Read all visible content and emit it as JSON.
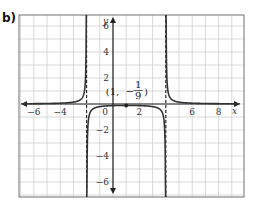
{
  "part_label": "b)",
  "chart_data": {
    "type": "line",
    "title": "",
    "function": "y = 1/((x+2)(x-4))",
    "xlabel": "x",
    "ylabel": "y",
    "xlim": [
      -7,
      10
    ],
    "ylim": [
      -7,
      7
    ],
    "grid": true,
    "x_tick_labels": [
      "-6",
      "-4",
      "0",
      "2",
      "6",
      "8"
    ],
    "y_tick_labels": [
      "6",
      "4",
      "2",
      "-2",
      "-4",
      "-6"
    ],
    "vertical_asymptotes": [
      -2,
      4
    ],
    "horizontal_asymptote": 0,
    "annotation": {
      "point": [
        1,
        -0.1111
      ],
      "text_prefix": "(1, ",
      "text_sign": "−",
      "frac_num": "1",
      "frac_den": "9",
      "text_suffix": ")"
    },
    "colors": {
      "curve": "#333333",
      "grid": "#cfcfcf",
      "axis": "#222222",
      "frame": "#888888"
    }
  }
}
